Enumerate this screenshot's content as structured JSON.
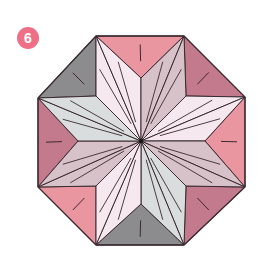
{
  "step": {
    "number": "6",
    "badge_color": "#ee6f86"
  },
  "diagram": {
    "shape": "octagon-eight-point-star",
    "center": [
      141,
      141
    ],
    "octagon_vertices": [
      [
        96,
        36
      ],
      [
        184,
        36
      ],
      [
        245,
        97
      ],
      [
        245,
        187
      ],
      [
        184,
        245
      ],
      [
        96,
        245
      ],
      [
        38,
        187
      ],
      [
        38,
        98
      ]
    ],
    "notches": [
      [
        141,
        78
      ],
      [
        186,
        96
      ],
      [
        205,
        141
      ],
      [
        186,
        186
      ],
      [
        141,
        204
      ],
      [
        96,
        186
      ],
      [
        78,
        141
      ],
      [
        96,
        96
      ]
    ],
    "colors": {
      "pink": "#ea96a1",
      "rose": "#c37a8c",
      "gray": "#8c8c8e",
      "pale": "#f6e8ef",
      "mauve": "#d6c2c8",
      "lightgray": "#d9dddd",
      "line": "#3a2a30"
    },
    "outer_triangle_colors": [
      "pink",
      "rose",
      "pink",
      "rose",
      "gray",
      "pink",
      "rose",
      "gray"
    ],
    "star_point_colors": [
      "pale",
      "mauve",
      "pale",
      "mauve",
      "lightgray",
      "pale",
      "mauve",
      "lightgray"
    ]
  }
}
